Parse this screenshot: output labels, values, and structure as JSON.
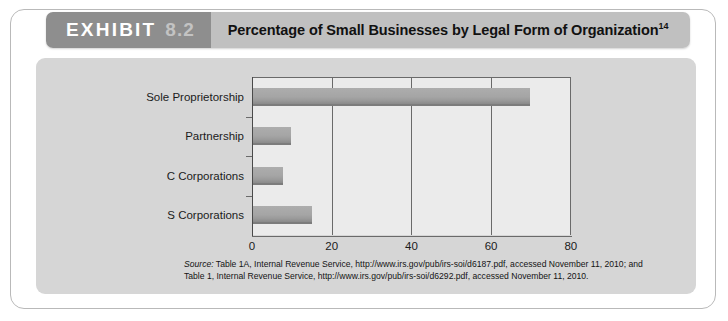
{
  "exhibit": {
    "label": "EXHIBIT",
    "number": "8.2",
    "title": "Percentage of Small Businesses by Legal Form of Organization",
    "title_superscript": "14"
  },
  "source": {
    "prefix": "Source:",
    "line1": " Table 1A, Internal Revenue Service, http://www.irs.gov/pub/irs-soi/d6187.pdf, accessed November 11, 2010; and",
    "line2": "Table 1, Internal Revenue Service, http://www.irs.gov/pub/irs-soi/d6292.pdf, accessed November 11, 2010."
  },
  "colors": {
    "header_tag_bg": "#8e8e8e",
    "header_title_bg": "#c0c0c0",
    "panel_bg": "#d6d6d6",
    "plot_bg": "#ebebeb",
    "bar_fill": "#a5a5a5",
    "axis": "#6a6a6a"
  },
  "chart_data": {
    "type": "bar",
    "orientation": "horizontal",
    "title": "Percentage of Small Businesses by Legal Form of Organization",
    "categories": [
      "Sole Proprietorship",
      "Partnership",
      "C Corporations",
      "S Corporations"
    ],
    "values": [
      69.5,
      9.5,
      7.5,
      14.7
    ],
    "xlabel": "",
    "ylabel": "",
    "xlim": [
      0,
      80
    ],
    "xticks": [
      0,
      20,
      40,
      60,
      80
    ],
    "xtick_labels": [
      "0",
      "20",
      "40",
      "60",
      "80"
    ],
    "grid": true,
    "grid_axis": "x",
    "legend": false
  }
}
